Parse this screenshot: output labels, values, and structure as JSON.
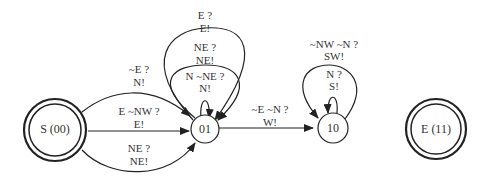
{
  "diagram": {
    "type": "state-machine",
    "nodes": [
      {
        "id": "S",
        "label": "S (00)",
        "kind": "start-accept"
      },
      {
        "id": "01",
        "label": "01",
        "kind": "state"
      },
      {
        "id": "10",
        "label": "10",
        "kind": "state"
      },
      {
        "id": "E",
        "label": "E (11)",
        "kind": "end-accept"
      }
    ],
    "edges": [
      {
        "from": "S",
        "to": "01",
        "cond": "~E ?",
        "action": "N!"
      },
      {
        "from": "S",
        "to": "01",
        "cond": "E ~NW ?",
        "action": "E!"
      },
      {
        "from": "S",
        "to": "01",
        "cond": "NE ?",
        "action": "NE!"
      },
      {
        "from": "01",
        "to": "01",
        "cond": "E ?",
        "action": "E!"
      },
      {
        "from": "01",
        "to": "01",
        "cond": "NE ?",
        "action": "NE!"
      },
      {
        "from": "01",
        "to": "01",
        "cond": "N ~NE ?",
        "action": "N!"
      },
      {
        "from": "01",
        "to": "10",
        "cond": "~E ~N ?",
        "action": "W!"
      },
      {
        "from": "10",
        "to": "10",
        "cond": "~NW ~N ?",
        "action": "SW!"
      },
      {
        "from": "10",
        "to": "10",
        "cond": "N ?",
        "action": "S!"
      }
    ]
  }
}
